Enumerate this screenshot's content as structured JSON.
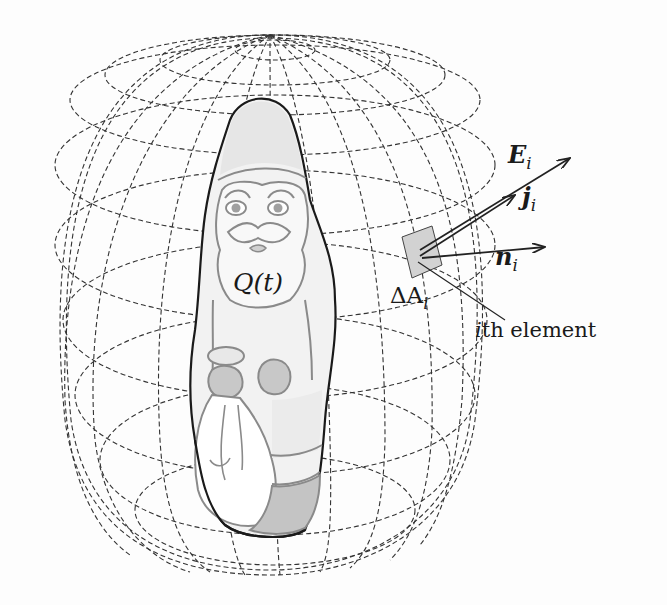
{
  "figure": {
    "labels": {
      "charge": "Q(t)",
      "area_element": "ΔA",
      "area_sub": "i",
      "element_caption_italic": "i",
      "element_caption_rest": "th element",
      "E_main": "E",
      "E_sub": "i",
      "j_main": "j",
      "j_sub": "i",
      "n_main": "n",
      "n_sub": "i"
    },
    "colors": {
      "line": "#222222",
      "grid": "#333333",
      "fill_light": "#ededed",
      "fill_mid": "#cfcfcf",
      "fill_dark": "#b8b8b8",
      "element_fill": "#d2d2d2"
    }
  }
}
